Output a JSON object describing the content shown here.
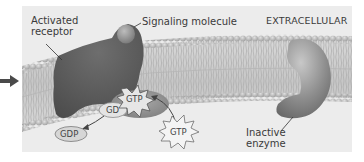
{
  "diagram": {
    "type": "biology-signaling-pathway",
    "region_label": "EXTRACELLULAR",
    "labels": {
      "activated_receptor_line1": "Activated",
      "activated_receptor_line2": "receptor",
      "signaling_molecule": "Signaling molecule",
      "extracellular": "EXTRACELLULAR",
      "inactive_enzyme_line1": "Inactive",
      "inactive_enzyme_line2": "enzyme"
    },
    "chips": {
      "gtp_bound": "GTP",
      "gdp_bound_partial": "GD",
      "gdp_released": "GDP",
      "gtp_free": "GTP"
    },
    "components": [
      {
        "id": "membrane",
        "name": "Plasma membrane (phospholipid bilayer)"
      },
      {
        "id": "receptor",
        "name": "Activated receptor"
      },
      {
        "id": "signal",
        "name": "Signaling molecule"
      },
      {
        "id": "gprotein",
        "name": "G protein"
      },
      {
        "id": "enzyme",
        "name": "Inactive enzyme"
      }
    ],
    "colors": {
      "panel_bg": "#ececec",
      "receptor": "#5e5e5e",
      "enzyme": "#8f8f8f",
      "gprotein": "#9a9a9a",
      "lipid_head": "#b9b9b9",
      "text": "#3a3a3a",
      "arrow": "#4a4a4a"
    }
  }
}
